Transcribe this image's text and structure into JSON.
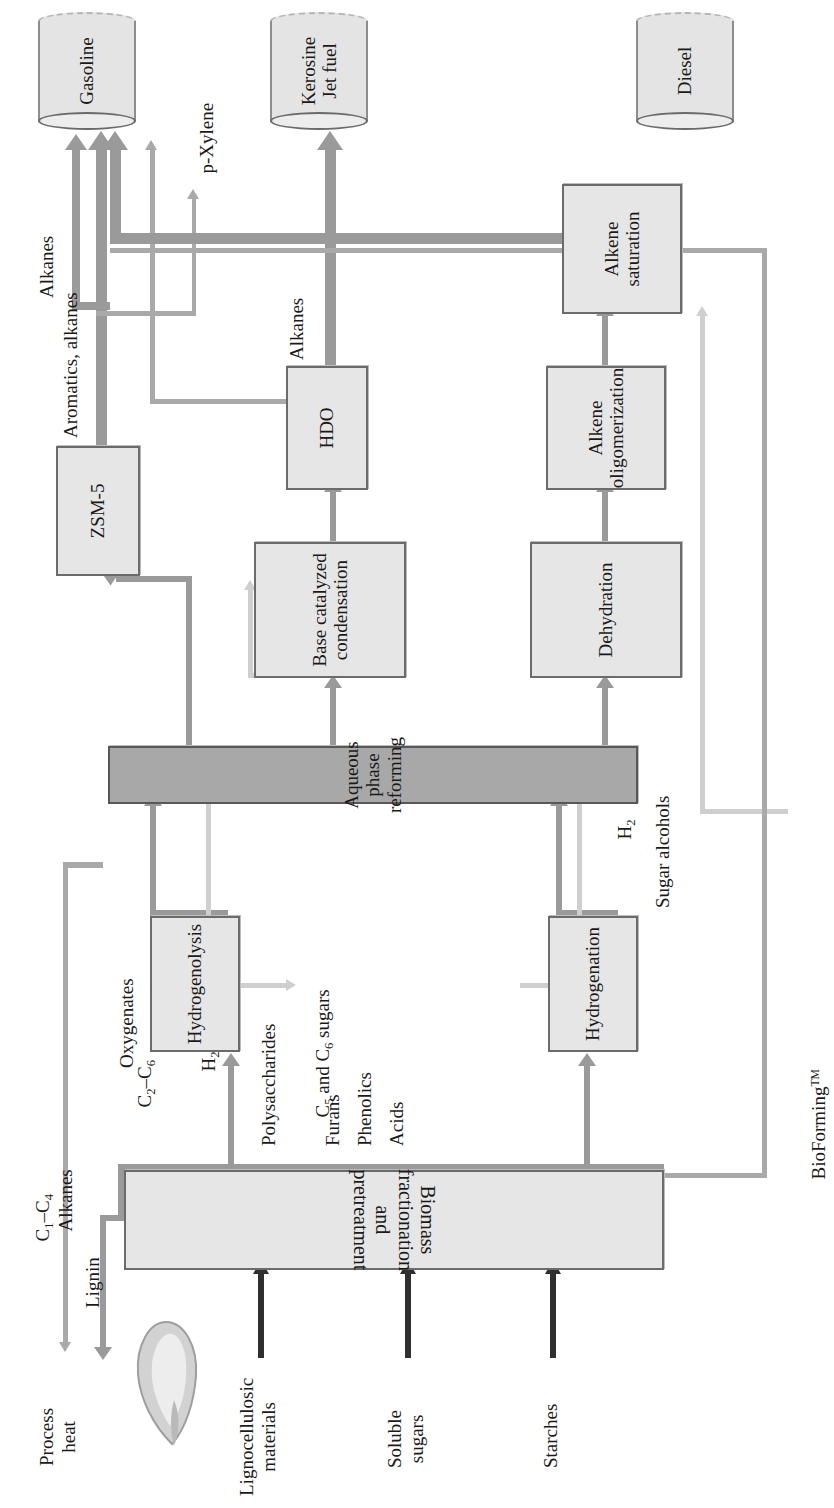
{
  "figure": {
    "trademark_label": "BioForming",
    "trademark_sup": "TM"
  },
  "feedstocks": [
    {
      "id": "lignocellulosic",
      "label": "Lignocellulosic\nmaterials"
    },
    {
      "id": "soluble-sugars",
      "label": "Soluble\nsugars"
    },
    {
      "id": "starches",
      "label": "Starches"
    }
  ],
  "units": [
    {
      "id": "biomass-fractionation",
      "label": "Biomass fractionation\nand pretreatment",
      "shade": "light"
    },
    {
      "id": "hydrogenolysis",
      "label": "Hydrogenolysis",
      "shade": "light"
    },
    {
      "id": "hydrogenation",
      "label": "Hydrogenation",
      "shade": "light"
    },
    {
      "id": "aqueous-phase-reforming",
      "label": "Aqueous phase\nreforming",
      "shade": "dark"
    },
    {
      "id": "base-catalyzed-condensation",
      "label": "Base catalyzed\ncondensation",
      "shade": "light"
    },
    {
      "id": "dehydration",
      "label": "Dehydration",
      "shade": "light"
    },
    {
      "id": "zsm-5",
      "label": "ZSM-5",
      "shade": "light"
    },
    {
      "id": "hdo",
      "label": "HDO",
      "shade": "light"
    },
    {
      "id": "alkene-oligomerization",
      "label": "Alkene\noligomerization",
      "shade": "light"
    },
    {
      "id": "alkene-saturation",
      "label": "Alkene\nsaturation",
      "shade": "light"
    }
  ],
  "products": [
    {
      "id": "gasoline",
      "label": "Gasoline"
    },
    {
      "id": "kerosene-jet",
      "label": "Kerosine\nJet fuel"
    },
    {
      "id": "diesel",
      "label": "Diesel"
    }
  ],
  "stream_labels": {
    "polysaccharides": "Polysaccharides",
    "c5_c6_sugars_pre": "C",
    "c5_c6_sugars_sub1": "5",
    "c5_c6_sugars_mid": " and C",
    "c5_c6_sugars_sub2": "6",
    "c5_c6_sugars_post": " sugars",
    "furans": "Furans",
    "phenolics": "Phenolics",
    "acids": "Acids",
    "lignin": "Lignin",
    "process_heat": "Process\nheat",
    "oxygenates": "Oxygenates",
    "sugar_alcohols": "Sugar alcohols",
    "h2_upper": "H",
    "h2_sub": "2",
    "h2_lower": "H",
    "c1_c4_pre": "C",
    "c1_c4_sub1": "1",
    "c1_c4_mid": "–C",
    "c1_c4_sub2": "4",
    "c1_c4_alkanes": "Alkanes",
    "c2_c6_pre": "C",
    "c2_c6_sub1": "2",
    "c2_c6_mid": "–C",
    "c2_c6_sub2": "6",
    "aromatics_alkanes": "Aromatics, alkanes",
    "alkanes_mid": "Alkanes",
    "alkanes_right": "Alkanes",
    "p_xylene_italic": "p-",
    "p_xylene_rest": "Xylene"
  },
  "colors": {
    "box_fill_light": "#e6e6e6",
    "box_fill_dark": "#a8a8a8",
    "box_border": "#6b6b6b",
    "connector_gray": "#9a9a9a",
    "connector_thin": "#a9a9a9",
    "connector_pale": "#cfcfcf",
    "feed_arrow_dark": "#2f2f2f",
    "page_background": "#ffffff"
  }
}
